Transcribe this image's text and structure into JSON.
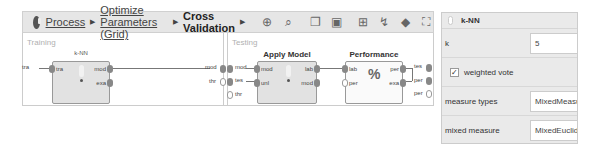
{
  "breadcrumb": {
    "items": [
      {
        "label": "Process",
        "link": true
      },
      {
        "label": "Optimize Parameters (Grid)",
        "link": true
      },
      {
        "label": "Cross Validation",
        "link": false
      }
    ],
    "separator": "▶"
  },
  "toolbar": {
    "icons": [
      "zoom-in-icon",
      "zoom-out-icon",
      "copy-icon",
      "paste-icon",
      "add-port-icon",
      "auto-wire-icon",
      "eraser-icon",
      "fit-icon"
    ],
    "glyphs": [
      "⊕",
      "⌕",
      "❐",
      "▣",
      "⊞",
      "↯",
      "◆",
      "⛶"
    ]
  },
  "canvas": {
    "training": {
      "label": "Training",
      "left_port": "tra",
      "right_ports": [
        "mod",
        "thr"
      ],
      "operator": {
        "name": "k-NN",
        "in_ports": [
          "tra"
        ],
        "out_ports": [
          "mod",
          "exa"
        ]
      }
    },
    "testing": {
      "label": "Testing",
      "left_ports": [
        "mod",
        "tes",
        "thr"
      ],
      "right_ports": [
        "tes",
        "per",
        "per"
      ],
      "apply_model": {
        "name": "Apply Model",
        "in_ports": [
          "mod",
          "unl"
        ],
        "out_ports": [
          "lab",
          "mod"
        ]
      },
      "performance": {
        "name": "Performance",
        "in_ports": [
          "lab",
          "per"
        ],
        "out_ports": [
          "per",
          "exa"
        ],
        "icon": "%"
      }
    }
  },
  "parameters": {
    "title": "k-NN",
    "rows": [
      {
        "label": "k",
        "value": "5",
        "type": "input"
      },
      {
        "label": "weighted vote",
        "checked": true,
        "type": "checkbox",
        "check": "✓"
      },
      {
        "label": "measure types",
        "value": "MixedMeasures",
        "type": "select"
      },
      {
        "label": "mixed measure",
        "value": "MixedEuclideanDistance",
        "type": "select"
      }
    ]
  }
}
